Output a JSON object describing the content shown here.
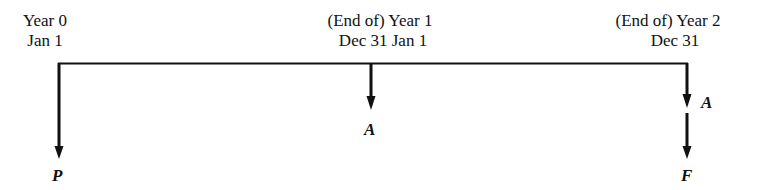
{
  "diagram": {
    "type": "cash-flow timeline",
    "points": [
      {
        "id": "year0",
        "line1": "Year 0",
        "line2": "Jan 1"
      },
      {
        "id": "year1",
        "line1": "(End of) Year 1",
        "line2": "Dec 31 Jan 1"
      },
      {
        "id": "year2",
        "line1": "(End of) Year 2",
        "line2": "Dec 31"
      }
    ],
    "flows": [
      {
        "at": "year0",
        "label": "P",
        "direction": "down"
      },
      {
        "at": "year1",
        "label": "A",
        "direction": "down"
      },
      {
        "at": "year2",
        "label": "A",
        "direction": "down"
      },
      {
        "at": "year2",
        "label": "F",
        "direction": "down"
      }
    ],
    "line_color": "#111111"
  }
}
